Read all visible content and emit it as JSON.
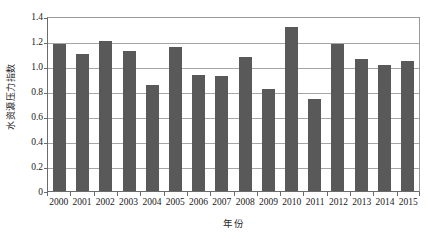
{
  "chart_data": {
    "type": "bar",
    "title": "",
    "xlabel": "年份",
    "ylabel": "水资源压力指数",
    "categories": [
      "2000",
      "2001",
      "2002",
      "2003",
      "2004",
      "2005",
      "2006",
      "2007",
      "2008",
      "2009",
      "2010",
      "2011",
      "2012",
      "2013",
      "2014",
      "2015"
    ],
    "values": [
      1.18,
      1.1,
      1.2,
      1.12,
      0.85,
      1.15,
      0.93,
      0.92,
      1.07,
      0.82,
      1.31,
      0.74,
      1.18,
      1.06,
      1.01,
      1.04
    ],
    "ylim": [
      0,
      1.4
    ],
    "yticks": [
      "0",
      "0.2",
      "0.4",
      "0.6",
      "0.8",
      "1.0",
      "1.2",
      "1.4"
    ],
    "ytick_values": [
      0,
      0.2,
      0.4,
      0.6,
      0.8,
      1.0,
      1.2,
      1.4
    ],
    "grid": true,
    "legend": null,
    "series_color": "#595959",
    "gridline_color": "#a6a6a6",
    "axis_color": "#6b6b6b",
    "background": "#ffffff"
  }
}
